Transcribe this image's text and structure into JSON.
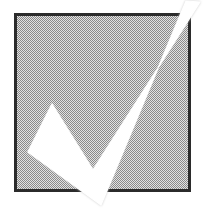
{
  "image": {
    "title": "Checkmark symbol",
    "width": 207,
    "height": 211,
    "background_color": "#ffffff",
    "style": "monochrome halftone / dithered line art"
  },
  "square": {
    "name": "gray-filled-square",
    "label": "Gray dithered square",
    "x": 14,
    "y": 13,
    "width": 177,
    "height": 179,
    "fill_color": "#b9b9b9",
    "fill_pattern": "halftone-checkerboard-dither",
    "pattern_dark_color": "#8a8a8a",
    "pattern_light_color": "#e2e2e2",
    "border_color": "#2b2b2b",
    "border_width": 3
  },
  "checkmark": {
    "name": "checkmark-glyph",
    "label": "White checkmark",
    "fill_color": "#ffffff",
    "edge_shadow_color": "#c9c9c9",
    "points": [
      {
        "label": "short-arm-top",
        "x": 52,
        "y": 104
      },
      {
        "label": "inner-notch",
        "x": 93,
        "y": 170
      },
      {
        "label": "long-arm-tip",
        "x": 200,
        "y": 2
      },
      {
        "label": "long-arm-tip-outer",
        "x": 186,
        "y": 1
      },
      {
        "label": "bottom-vertex",
        "x": 101,
        "y": 205
      },
      {
        "label": "short-arm-bottom-left",
        "x": 28,
        "y": 152
      }
    ],
    "extends_beyond_square": true,
    "overflow_edges": [
      "top-right",
      "bottom"
    ]
  },
  "accessibility": {
    "alt_text": "A large white check mark drawn over a gray shaded square"
  }
}
